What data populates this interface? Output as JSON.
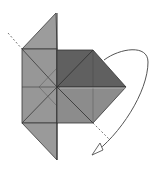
{
  "diagram": {
    "type": "origami-fold-step",
    "colors": {
      "background": "#ffffff",
      "light_paper": "#9a9a9a",
      "mid_paper": "#8a8a8a",
      "dark_paper": "#5e5e5e",
      "edge": "#3a3a3a",
      "arrow": "#555555",
      "fold_line": "#777777"
    },
    "elements": [
      {
        "name": "left-strip",
        "shape": "polygon"
      },
      {
        "name": "dark-upper-square",
        "shape": "polygon"
      },
      {
        "name": "lower-right-square",
        "shape": "polygon"
      },
      {
        "name": "diagonal-fold-line",
        "shape": "dashed-line"
      },
      {
        "name": "curved-fold-arrow",
        "shape": "arrow"
      }
    ]
  }
}
